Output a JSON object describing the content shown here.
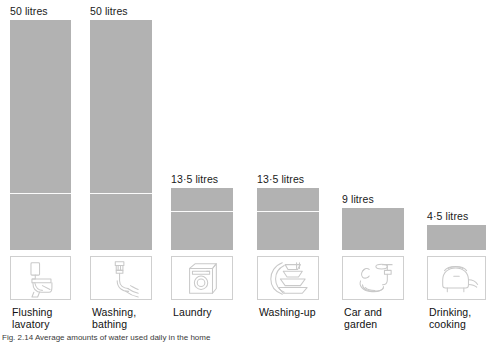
{
  "figure": {
    "caption": "Fig. 2.14 Average amounts of water used daily in the home",
    "units": "litres",
    "bar_color": "#b2b2b2",
    "box_border_color": "#cfcfcf"
  },
  "chart_data": {
    "type": "bar",
    "title": "",
    "xlabel": "",
    "ylabel": "litres",
    "categories": [
      "Flushing lavatory",
      "Washing, bathing",
      "Laundry",
      "Washing-up",
      "Car and garden",
      "Drinking, cooking"
    ],
    "values": [
      50,
      50,
      13.5,
      13.5,
      9,
      4.5
    ],
    "value_labels": [
      "50 litres",
      "50 litres",
      "13·5 litres",
      "13·5 litres",
      "9 litres",
      "4·5 litres"
    ],
    "ylim": [
      0,
      56
    ],
    "grid": false,
    "legend": "none"
  },
  "columns": [
    {
      "id": "flushing-lavatory",
      "value_label": "50 litres",
      "value": 50,
      "caption": "Flushing\nlavatory",
      "icon": "toilet-icon",
      "left": 10,
      "width": 61,
      "bar_height": 230,
      "split_from_bottom": 56
    },
    {
      "id": "washing-bathing",
      "value_label": "50 litres",
      "value": 50,
      "caption": "Washing,\nbathing",
      "icon": "tap-bath-icon",
      "left": 90,
      "width": 62,
      "bar_height": 230,
      "split_from_bottom": 56
    },
    {
      "id": "laundry",
      "value_label": "13·5 litres",
      "value": 13.5,
      "caption": "Laundry",
      "icon": "washing-machine-icon",
      "left": 171,
      "width": 62,
      "bar_height": 62,
      "split_from_bottom": 38
    },
    {
      "id": "washing-up",
      "value_label": "13·5 litres",
      "value": 13.5,
      "caption": "Washing-up",
      "icon": "dishes-icon",
      "left": 257,
      "width": 62,
      "bar_height": 62,
      "split_from_bottom": 38
    },
    {
      "id": "car-and-garden",
      "value_label": "9 litres",
      "value": 9,
      "caption": "Car and\ngarden",
      "icon": "hose-tap-icon",
      "left": 342,
      "width": 62,
      "bar_height": 42,
      "split_from_bottom": 0
    },
    {
      "id": "drinking-cooking",
      "value_label": "4·5 litres",
      "value": 4.5,
      "caption": "Drinking,\ncooking",
      "icon": "kettle-icon",
      "left": 427,
      "width": 59,
      "bar_height": 25,
      "split_from_bottom": 0
    }
  ]
}
